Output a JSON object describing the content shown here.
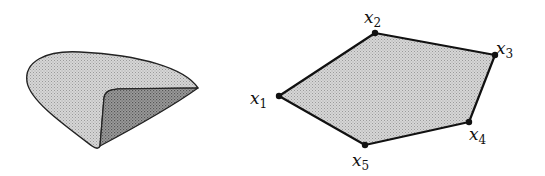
{
  "figure": {
    "left_shape": {
      "description": "nonconvex set (curved shape with fold)",
      "fill_light": "#c8c8c8",
      "fill_dark": "#8a8a8a",
      "stroke": "#222222"
    },
    "right_shape": {
      "description": "convex polygon (convex hull of points)",
      "fill": "#c8c8c8",
      "stroke": "#111111",
      "vertices": [
        {
          "name": "x1",
          "base": "x",
          "sub": "1",
          "x": 279,
          "y": 96
        },
        {
          "name": "x2",
          "base": "x",
          "sub": "2",
          "x": 375,
          "y": 33
        },
        {
          "name": "x3",
          "base": "x",
          "sub": "3",
          "x": 495,
          "y": 55
        },
        {
          "name": "x4",
          "base": "x",
          "sub": "4",
          "x": 469,
          "y": 122
        },
        {
          "name": "x5",
          "base": "x",
          "sub": "5",
          "x": 365,
          "y": 145
        }
      ]
    },
    "labels": {
      "x1": {
        "base": "x",
        "sub": "1"
      },
      "x2": {
        "base": "x",
        "sub": "2"
      },
      "x3": {
        "base": "x",
        "sub": "3"
      },
      "x4": {
        "base": "x",
        "sub": "4"
      },
      "x5": {
        "base": "x",
        "sub": "5"
      }
    }
  }
}
